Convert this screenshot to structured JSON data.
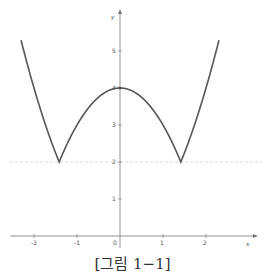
{
  "chart_data": {
    "type": "line",
    "title": "",
    "xlabel": "x",
    "ylabel": "y",
    "xlim": [
      -2.8,
      3.2
    ],
    "ylim": [
      -0.3,
      6.0
    ],
    "x_ticks": [
      -2,
      -1,
      0,
      1,
      2
    ],
    "y_ticks": [
      1,
      2,
      3,
      4,
      5
    ],
    "grid": false,
    "series": [
      {
        "name": "y = |2 - x^2| + 2",
        "x": [
          -2.3,
          -2.0,
          -1.7,
          -1.414,
          -1.0,
          -0.5,
          0,
          0.5,
          1.0,
          1.414,
          1.7,
          2.0,
          2.3
        ],
        "values": [
          5.29,
          4.0,
          2.89,
          2.0,
          3.0,
          3.75,
          4.0,
          3.75,
          3.0,
          2.0,
          2.89,
          4.0,
          5.29
        ],
        "color": "#555555"
      }
    ],
    "annotations": [
      {
        "type": "hline",
        "y": 2,
        "style": "dashed",
        "color": "#cccccc"
      }
    ]
  },
  "axes": {
    "x_label": "x",
    "y_label": "y",
    "origin_label": "0",
    "x_tick_labels": [
      "-2",
      "-1",
      "1",
      "2"
    ],
    "y_tick_labels": [
      "1",
      "2",
      "3",
      "4",
      "5"
    ]
  },
  "caption": "[그림 1−1]"
}
